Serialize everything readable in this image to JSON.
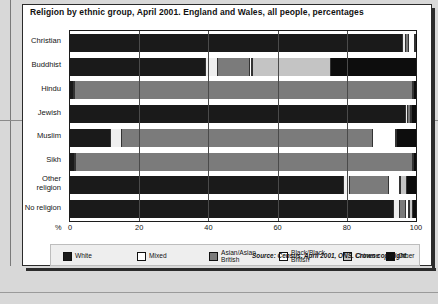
{
  "chart_data": {
    "type": "bar",
    "orientation": "horizontal",
    "stacked": true,
    "title": "Religion by ethnic group, April 2001. England and Wales, all people, percentages",
    "xlabel": "%",
    "ylabel": "",
    "xlim": [
      0,
      100
    ],
    "xticks": [
      "0",
      "20",
      "40",
      "60",
      "80",
      "100"
    ],
    "grid": true,
    "legend_position": "bottom",
    "categories": [
      "Christian",
      "Buddhist",
      "Hindu",
      "Jewish",
      "Muslim",
      "Sikh",
      "Other religion",
      "No religion"
    ],
    "series": [
      {
        "name": "White",
        "color": "#1a1a1a",
        "values": [
          96.0,
          38.9,
          0.9,
          96.8,
          11.6,
          1.2,
          79.0,
          93.4
        ]
      },
      {
        "name": "Mixed",
        "color": "#efefef",
        "values": [
          1.1,
          3.8,
          0.6,
          0.8,
          3.4,
          0.5,
          2.0,
          1.9
        ]
      },
      {
        "name": "Asian/Asian British",
        "color": "#7b7b7b",
        "values": [
          0.7,
          8.9,
          97.4,
          0.6,
          72.4,
          97.2,
          11.0,
          1.6
        ]
      },
      {
        "name": "Black/Black British",
        "color": "#ffffff",
        "values": [
          1.9,
          1.0,
          0.2,
          0.3,
          6.8,
          0.2,
          3.5,
          1.1
        ]
      },
      {
        "name": "Chinese",
        "color": "#c4c4c4",
        "values": [
          0.2,
          22.8,
          0.3,
          0.3,
          0.3,
          0.3,
          2.0,
          1.0
        ]
      },
      {
        "name": "Other",
        "color": "#0d0d0d",
        "values": [
          0.1,
          24.6,
          0.6,
          1.2,
          5.5,
          0.6,
          2.5,
          1.0
        ]
      }
    ]
  },
  "legend": {
    "items": [
      {
        "label": "White",
        "color": "#1a1a1a"
      },
      {
        "label": "Mixed",
        "color": "#ffffff"
      },
      {
        "label": "Asian/Asian\nBritish",
        "color": "#7b7b7b"
      },
      {
        "label": "Black/Black\nBritish",
        "color": "#ffffff"
      },
      {
        "label": "Chinese",
        "color": "#c4c4c4"
      },
      {
        "label": "Other",
        "color": "#0d0d0d"
      }
    ]
  },
  "source": "Source: Census, April 2001, ONS. Crown copyright."
}
